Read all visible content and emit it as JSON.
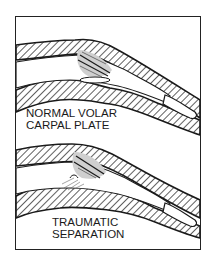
{
  "diagram": {
    "panels": [
      {
        "id": "normal",
        "label_lines": [
          "NORMAL VOLAR",
          "CARPAL PLATE"
        ]
      },
      {
        "id": "traumatic",
        "label_lines": [
          "TRAUMATIC",
          "SEPARATION"
        ]
      }
    ],
    "colors": {
      "line": "#1a1a1a",
      "background": "#ffffff"
    }
  }
}
